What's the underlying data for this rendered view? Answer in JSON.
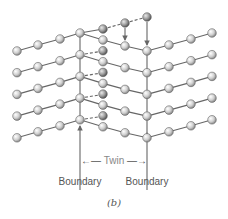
{
  "figure": {
    "caption": "(b)",
    "twin_label": "Twin",
    "boundary_left_label": "Boundary",
    "boundary_right_label": "Boundary"
  },
  "colors": {
    "atom_fill": "#d8d8d8",
    "atom_dark_fill": "#a8a8a8",
    "atom_stroke": "#555555",
    "bond": "#666666",
    "text": "#555555"
  },
  "lattice": {
    "rows": 5,
    "row_spacing": 21.7,
    "left_chain": [
      [
        17,
        51
      ],
      [
        38,
        45
      ],
      [
        60,
        39
      ],
      [
        80,
        33
      ]
    ],
    "twin_chain": [
      [
        103,
        40
      ],
      [
        125,
        46
      ],
      [
        147,
        51
      ]
    ],
    "right_chain": [
      [
        169,
        45
      ],
      [
        191,
        39
      ],
      [
        212,
        33
      ]
    ],
    "displaced_atom": [
      103,
      29
    ],
    "top_displaced": [
      [
        125,
        23
      ],
      [
        147,
        17
      ]
    ]
  }
}
